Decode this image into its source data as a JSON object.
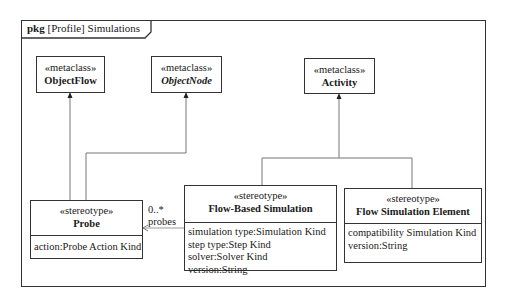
{
  "diagram": {
    "frame": {
      "kind": "pkg",
      "title": "[Profile] Simulations"
    },
    "metaclasses": [
      {
        "stereotype": "«metaclass»",
        "name": "ObjectFlow",
        "italic": false
      },
      {
        "stereotype": "«metaclass»",
        "name": "ObjectNode",
        "italic": true
      },
      {
        "stereotype": "«metaclass»",
        "name": "Activity",
        "italic": false
      }
    ],
    "stereotypes": [
      {
        "stereotype": "«stereotype»",
        "name": "Probe",
        "attributes": [
          "action:Probe Action Kind"
        ]
      },
      {
        "stereotype": "«stereotype»",
        "name": "Flow-Based Simulation",
        "attributes": [
          "simulation type:Simulation Kind",
          "step type:Step Kind",
          "solver:Solver Kind",
          "version:String"
        ]
      },
      {
        "stereotype": "«stereotype»",
        "name": "Flow Simulation Element",
        "attributes": [
          "compatibility Simulation Kind",
          "version:String"
        ]
      }
    ],
    "association": {
      "multiplicity": "0..*",
      "role": "probes"
    },
    "colors": {
      "line": "#333333",
      "background": "#ffffff",
      "text": "#1a1a1a"
    }
  }
}
